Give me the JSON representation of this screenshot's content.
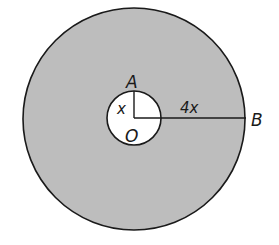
{
  "diagram": {
    "labels": {
      "A": "A",
      "O": "O",
      "B": "B",
      "inner_radius": "x",
      "outer_segment": "4x"
    },
    "colors": {
      "shaded_region": "#bdbdbd",
      "inner_circle": "#ffffff",
      "stroke": "#1a1a1a"
    }
  }
}
